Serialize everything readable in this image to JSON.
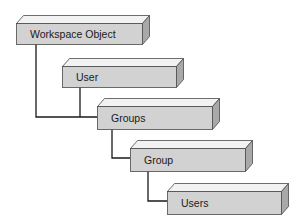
{
  "diagram": {
    "colors": {
      "front": "#d2d2d2",
      "top": "#f2f2f2",
      "side": "#a9a9a9",
      "edge": "#4a4a4a",
      "connector": "#1a1a1a"
    },
    "nodes": [
      {
        "id": "workspace-object",
        "label": "Workspace Object",
        "x": 16,
        "y": 23,
        "w": 126,
        "h": 21,
        "depth_x": 7,
        "depth_y": 8
      },
      {
        "id": "user",
        "label": "User",
        "x": 62,
        "y": 66,
        "w": 114,
        "h": 21,
        "depth_x": 7,
        "depth_y": 8
      },
      {
        "id": "groups",
        "label": "Groups",
        "x": 97,
        "y": 106,
        "w": 115,
        "h": 23,
        "depth_x": 7,
        "depth_y": 8
      },
      {
        "id": "group",
        "label": "Group",
        "x": 130,
        "y": 148,
        "w": 115,
        "h": 23,
        "depth_x": 7,
        "depth_y": 8
      },
      {
        "id": "users",
        "label": "Users",
        "x": 167,
        "y": 191,
        "w": 114,
        "h": 23,
        "depth_x": 7,
        "depth_y": 8
      }
    ],
    "edges": [
      {
        "from": "workspace-object",
        "to": "groups",
        "points": [
          [
            36,
            44
          ],
          [
            36,
            117
          ],
          [
            97,
            117
          ]
        ]
      },
      {
        "from": "user",
        "to": "groups",
        "points": [
          [
            80,
            87
          ],
          [
            80,
            117
          ]
        ]
      },
      {
        "from": "groups",
        "to": "group",
        "points": [
          [
            112,
            129
          ],
          [
            112,
            158
          ],
          [
            130,
            158
          ]
        ]
      },
      {
        "from": "group",
        "to": "users",
        "points": [
          [
            148,
            171
          ],
          [
            148,
            201
          ],
          [
            167,
            201
          ]
        ]
      }
    ]
  }
}
